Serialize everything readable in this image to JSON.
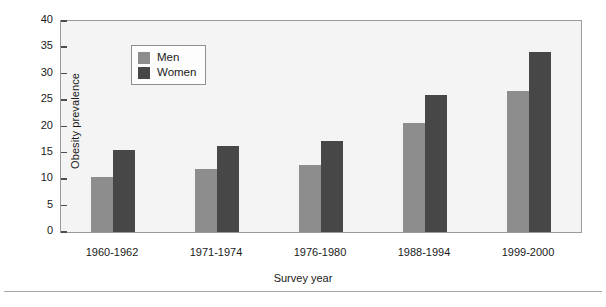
{
  "chart_data": {
    "type": "bar",
    "title": "",
    "xlabel": "Survey year",
    "ylabel": "Obesity prevalence",
    "categories": [
      "1960-1962",
      "1971-1974",
      "1976-1980",
      "1988-1994",
      "1999-2000"
    ],
    "series": [
      {
        "name": "Men",
        "color": "#8d8d8d",
        "values": [
          10.4,
          12.0,
          12.7,
          20.6,
          26.8
        ]
      },
      {
        "name": "Women",
        "color": "#474747",
        "values": [
          15.6,
          16.4,
          17.3,
          25.9,
          34.2
        ]
      }
    ],
    "ylim": [
      0,
      40
    ],
    "yticks": [
      0,
      5,
      10,
      15,
      20,
      25,
      30,
      35,
      40
    ],
    "ytick_labels": [
      "0",
      "5",
      "10",
      "15",
      "20",
      "25",
      "30",
      "35",
      "40"
    ],
    "grid": false,
    "legend_position": "upper left inside",
    "legend_entries": [
      "Men",
      "Women"
    ],
    "plot_background": "#f4f4f4",
    "frame_color": "#9a9a9a"
  },
  "axes": {
    "y_title": "Obesity prevalence",
    "x_title": "Survey year"
  }
}
